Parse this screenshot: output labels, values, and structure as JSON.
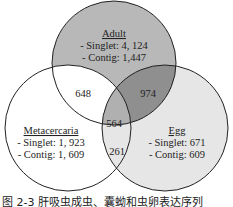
{
  "diagram": {
    "type": "venn3",
    "colors": {
      "adult_fill": "#b8b8b8",
      "egg_fill": "#e6e6e6",
      "metacercaria_fill": "#ffffff",
      "adult_egg_overlap": "#8f8f8f",
      "stroke": "#222222"
    },
    "sets": [
      {
        "name": "Adult",
        "lines": [
          "- Singlet: 4, 124",
          "- Contig: 1,447"
        ]
      },
      {
        "name": "Metacercaria",
        "lines": [
          "- Singlet: 1, 923",
          "- Contig: 1, 609"
        ]
      },
      {
        "name": "Egg",
        "lines": [
          "- Singlet: 671",
          "- Contig: 609"
        ]
      }
    ],
    "intersections": {
      "adult_metacercaria": "648",
      "adult_egg": "974",
      "adult_metacercaria_egg": "564",
      "metacercaria_egg": "261"
    }
  },
  "caption": "图 2-3   肝吸虫成虫、囊蚴和虫卵表达序列"
}
